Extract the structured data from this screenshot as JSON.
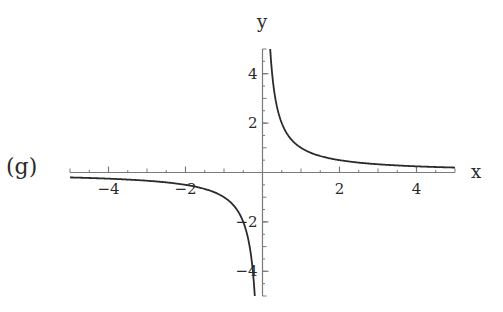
{
  "panel_label": "(g)",
  "chart_data": {
    "type": "line",
    "title": "",
    "function": "y = 1/x",
    "xlabel": "x",
    "ylabel": "y",
    "xlim": [
      -5,
      5
    ],
    "ylim": [
      -5,
      5
    ],
    "x_ticks": [
      -4,
      -2,
      2,
      4
    ],
    "x_tick_labels": [
      "−4",
      "−2",
      "2",
      "4"
    ],
    "y_ticks": [
      -4,
      -2,
      2,
      4
    ],
    "y_tick_labels": [
      "−4",
      "−2",
      "2",
      "4"
    ],
    "minor_tick_step": 0.5,
    "grid": false,
    "legend": "none",
    "series": [
      {
        "name": "1/x (x<0)",
        "x": [
          -5,
          -4,
          -3,
          -2,
          -1.5,
          -1,
          -0.75,
          -0.5,
          -0.4,
          -0.3,
          -0.25,
          -0.2
        ],
        "y": [
          -0.2,
          -0.25,
          -0.333,
          -0.5,
          -0.667,
          -1,
          -1.333,
          -2,
          -2.5,
          -3.333,
          -4,
          -5
        ]
      },
      {
        "name": "1/x (x>0)",
        "x": [
          0.2,
          0.25,
          0.3,
          0.4,
          0.5,
          0.75,
          1,
          1.5,
          2,
          3,
          4,
          5
        ],
        "y": [
          5,
          4,
          3.333,
          2.5,
          2,
          1.333,
          1,
          0.667,
          0.5,
          0.333,
          0.25,
          0.2
        ]
      }
    ],
    "line_color": "#2b2b2b",
    "axis_color": "#7a7a7a"
  }
}
